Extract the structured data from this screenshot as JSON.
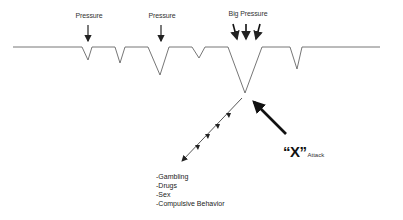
{
  "diagram": {
    "labels": {
      "pressure_1": "Pressure",
      "pressure_2": "Pressure",
      "big_pressure": "Big Pressure"
    },
    "attack": {
      "symbol": "“X”",
      "word": "Attack"
    },
    "outcomes": [
      "-Gambling",
      "-Drugs",
      "-Sex",
      "-Compulsive Behavior"
    ],
    "colors": {
      "line": "#555555",
      "arrow": "#111111",
      "background": "#ffffff"
    }
  }
}
